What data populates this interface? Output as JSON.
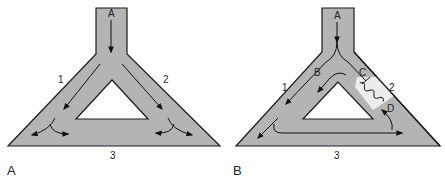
{
  "figure": {
    "colors": {
      "channel_fill": "#b4b4b4",
      "channel_outline": "#1a1a1a",
      "hole_fill": "#ffffff",
      "arrow": "#111111",
      "blocked_band": "#ededed",
      "label": "#222222"
    },
    "panels": [
      {
        "id": "A",
        "panel_label": "A",
        "labels": {
          "inflow": "A",
          "pathway_left": "1",
          "pathway_right": "2",
          "pathway_bottom": "3"
        },
        "description": "Normal conduction: impulse from A splits into pathways 1 and 2, collides/cancels in pathway 3"
      },
      {
        "id": "B",
        "panel_label": "B",
        "labels": {
          "inflow": "A",
          "point_b": "B",
          "point_c": "C",
          "point_d": "D",
          "pathway_left": "1",
          "pathway_right": "2",
          "pathway_bottom": "3"
        },
        "description": "Reentry: unidirectional block at C in pathway 2 (depressed region), impulse travels 1 → 3 and retrogradely through D"
      }
    ]
  }
}
